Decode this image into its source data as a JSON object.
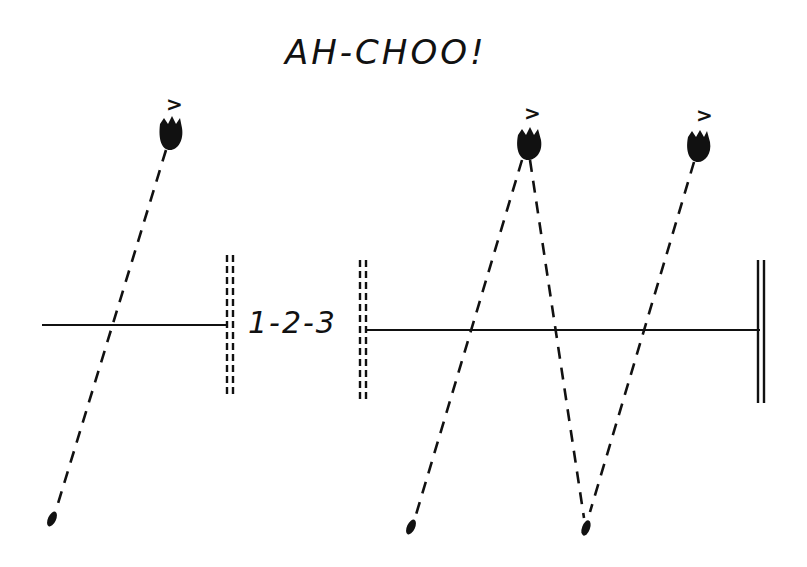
{
  "title": "AH-CHOO!",
  "gap_label": "1-2-3",
  "colors": {
    "ink": "#111111",
    "background": "#ffffff"
  },
  "figures": [
    {
      "name": "sneezer-1",
      "eye_glyph": ">",
      "head": {
        "x": 172,
        "y": 132
      },
      "droplet": {
        "x": 52,
        "y": 519
      }
    },
    {
      "name": "sneezer-2",
      "eye_glyph": ">",
      "head": {
        "x": 530,
        "y": 143
      },
      "droplets": [
        {
          "x": 411,
          "y": 527
        },
        {
          "x": 586,
          "y": 528
        }
      ]
    },
    {
      "name": "sneezer-3",
      "eye_glyph": ">",
      "head": {
        "x": 698,
        "y": 145
      }
    }
  ],
  "barriers": {
    "left_line": {
      "x1": 42,
      "x2": 228,
      "y": 325
    },
    "right_line": {
      "x1": 363,
      "x2": 760,
      "y": 330
    },
    "dashed_walls": [
      {
        "x": 230,
        "y1": 255,
        "y2": 397
      },
      {
        "x": 363,
        "y1": 260,
        "y2": 402
      }
    ],
    "solid_wall": {
      "x": 762,
      "y1": 260,
      "y2": 403
    }
  }
}
